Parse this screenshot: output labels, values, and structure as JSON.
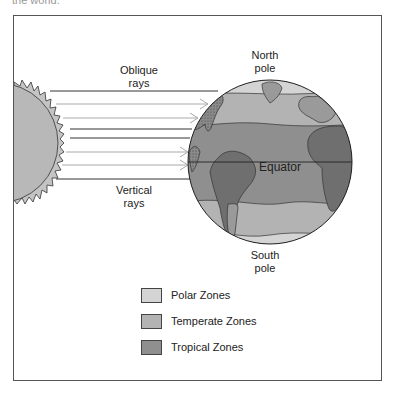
{
  "header_fragment": "the world.",
  "labels": {
    "oblique": "Oblique\nrays",
    "oblique_line1": "Oblique",
    "oblique_line2": "rays",
    "vertical_line1": "Vertical",
    "vertical_line2": "rays",
    "north_line1": "North",
    "north_line2": "pole",
    "south_line1": "South",
    "south_line2": "pole",
    "equator": "Equator"
  },
  "legend": {
    "items": [
      {
        "label": "Polar Zones",
        "color": "#d4d4d4"
      },
      {
        "label": "Temperate Zones",
        "color": "#b3b3b3"
      },
      {
        "label": "Tropical Zones",
        "color": "#8f8f8f"
      }
    ]
  },
  "colors": {
    "frame": "#555555",
    "sun_fill": "#b8b8b8",
    "ray_dark": "#333333",
    "ray_light": "#aaaaaa",
    "polar": "#d4d4d4",
    "temperate": "#b3b3b3",
    "tropical": "#8f8f8f",
    "land_tropical": "#6f6f6f",
    "land_temperate": "#9a9a9a"
  },
  "rays": [
    {
      "y": 91,
      "x1": 50,
      "x2": 218,
      "style": "dark",
      "arrow": false
    },
    {
      "y": 104,
      "x1": 56,
      "x2": 208,
      "style": "light",
      "arrow": true
    },
    {
      "y": 118,
      "x1": 63,
      "x2": 198,
      "style": "light",
      "arrow": true
    },
    {
      "y": 129,
      "x1": 70,
      "x2": 192,
      "style": "dark",
      "arrow": false
    },
    {
      "y": 138,
      "x1": 70,
      "x2": 190,
      "style": "dark",
      "arrow": false
    },
    {
      "y": 152,
      "x1": 66,
      "x2": 188,
      "style": "light",
      "arrow": true
    },
    {
      "y": 165,
      "x1": 62,
      "x2": 188,
      "style": "light",
      "arrow": true
    },
    {
      "y": 179,
      "x1": 56,
      "x2": 192,
      "style": "dark",
      "arrow": false
    }
  ]
}
